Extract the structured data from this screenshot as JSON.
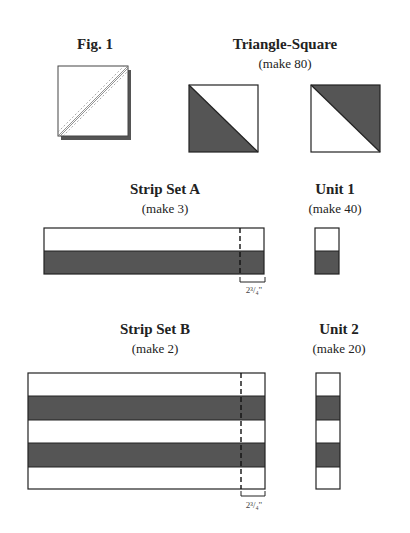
{
  "fig1": {
    "label": "Fig. 1"
  },
  "triangle_square": {
    "title": "Triangle-Square",
    "quantity": "(make 80)"
  },
  "strip_set_a": {
    "title": "Strip Set A",
    "quantity": "(make 3)",
    "cut_measurement": "2³/₄\""
  },
  "unit1": {
    "title": "Unit 1",
    "quantity": "(make 40)"
  },
  "strip_set_b": {
    "title": "Strip Set B",
    "quantity": "(make 2)",
    "cut_measurement": "2³/₄\""
  },
  "unit2": {
    "title": "Unit 2",
    "quantity": "(make 20)"
  },
  "colors": {
    "dark_fabric": "#555555",
    "light_fabric": "#ffffff",
    "outline": "#222222"
  }
}
